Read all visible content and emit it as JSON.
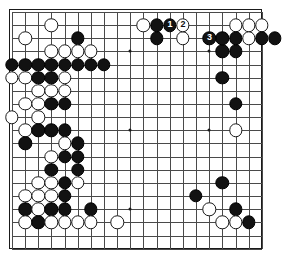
{
  "diagram": {
    "board": {
      "cols": 20,
      "rows": 19,
      "origin_x": 11,
      "origin_y": 11,
      "spacing": 13.15,
      "line_color": "#4a4a4a",
      "border_color": "#1a1a1a",
      "background_color": "#ffffff",
      "black_color": "#121212",
      "white_color": "#ffffff"
    },
    "hoshi": [
      {
        "c": 3,
        "r": 3
      },
      {
        "c": 9,
        "r": 3
      },
      {
        "c": 15,
        "r": 3
      },
      {
        "c": 3,
        "r": 9
      },
      {
        "c": 9,
        "r": 9
      },
      {
        "c": 15,
        "r": 9
      },
      {
        "c": 3,
        "r": 15
      },
      {
        "c": 9,
        "r": 15
      },
      {
        "c": 15,
        "r": 15
      }
    ],
    "stones": [
      {
        "c": 10,
        "r": 1,
        "color": "white"
      },
      {
        "c": 11,
        "r": 1,
        "color": "black"
      },
      {
        "c": 3,
        "r": 1,
        "color": "white"
      },
      {
        "c": 17,
        "r": 1,
        "color": "white"
      },
      {
        "c": 18,
        "r": 1,
        "color": "white"
      },
      {
        "c": 19,
        "r": 1,
        "color": "white"
      },
      {
        "c": 1,
        "r": 2,
        "color": "white"
      },
      {
        "c": 5,
        "r": 2,
        "color": "black"
      },
      {
        "c": 11,
        "r": 2,
        "color": "black"
      },
      {
        "c": 17,
        "r": 2,
        "color": "black"
      },
      {
        "c": 18,
        "r": 2,
        "color": "white"
      },
      {
        "c": 19,
        "r": 2,
        "color": "black"
      },
      {
        "c": 20,
        "r": 2,
        "color": "black"
      },
      {
        "c": 3,
        "r": 3,
        "color": "white"
      },
      {
        "c": 4,
        "r": 3,
        "color": "white"
      },
      {
        "c": 5,
        "r": 3,
        "color": "white"
      },
      {
        "c": 6,
        "r": 3,
        "color": "white"
      },
      {
        "c": 16,
        "r": 3,
        "color": "black"
      },
      {
        "c": 17,
        "r": 3,
        "color": "black"
      },
      {
        "c": 0,
        "r": 4,
        "color": "black"
      },
      {
        "c": 1,
        "r": 4,
        "color": "black"
      },
      {
        "c": 2,
        "r": 4,
        "color": "black"
      },
      {
        "c": 3,
        "r": 4,
        "color": "black"
      },
      {
        "c": 4,
        "r": 4,
        "color": "black"
      },
      {
        "c": 5,
        "r": 4,
        "color": "black"
      },
      {
        "c": 6,
        "r": 4,
        "color": "black"
      },
      {
        "c": 7,
        "r": 4,
        "color": "black"
      },
      {
        "c": 0,
        "r": 5,
        "color": "white"
      },
      {
        "c": 1,
        "r": 5,
        "color": "white"
      },
      {
        "c": 2,
        "r": 5,
        "color": "black"
      },
      {
        "c": 3,
        "r": 5,
        "color": "black"
      },
      {
        "c": 4,
        "r": 5,
        "color": "white"
      },
      {
        "c": 16,
        "r": 5,
        "color": "black"
      },
      {
        "c": 2,
        "r": 6,
        "color": "white"
      },
      {
        "c": 3,
        "r": 6,
        "color": "white"
      },
      {
        "c": 4,
        "r": 6,
        "color": "white"
      },
      {
        "c": 1,
        "r": 7,
        "color": "white"
      },
      {
        "c": 2,
        "r": 7,
        "color": "white"
      },
      {
        "c": 3,
        "r": 7,
        "color": "black"
      },
      {
        "c": 4,
        "r": 7,
        "color": "black"
      },
      {
        "c": 17,
        "r": 7,
        "color": "black"
      },
      {
        "c": 0,
        "r": 8,
        "color": "white"
      },
      {
        "c": 2,
        "r": 8,
        "color": "white"
      },
      {
        "c": 1,
        "r": 9,
        "color": "white"
      },
      {
        "c": 2,
        "r": 9,
        "color": "black"
      },
      {
        "c": 3,
        "r": 9,
        "color": "black"
      },
      {
        "c": 4,
        "r": 9,
        "color": "black"
      },
      {
        "c": 17,
        "r": 9,
        "color": "white"
      },
      {
        "c": 1,
        "r": 10,
        "color": "black"
      },
      {
        "c": 4,
        "r": 10,
        "color": "white"
      },
      {
        "c": 5,
        "r": 10,
        "color": "black"
      },
      {
        "c": 3,
        "r": 11,
        "color": "white"
      },
      {
        "c": 4,
        "r": 11,
        "color": "black"
      },
      {
        "c": 5,
        "r": 11,
        "color": "black"
      },
      {
        "c": 3,
        "r": 12,
        "color": "black"
      },
      {
        "c": 5,
        "r": 12,
        "color": "black"
      },
      {
        "c": 2,
        "r": 13,
        "color": "white"
      },
      {
        "c": 3,
        "r": 13,
        "color": "white"
      },
      {
        "c": 4,
        "r": 13,
        "color": "black"
      },
      {
        "c": 5,
        "r": 13,
        "color": "white"
      },
      {
        "c": 16,
        "r": 13,
        "color": "black"
      },
      {
        "c": 1,
        "r": 14,
        "color": "white"
      },
      {
        "c": 2,
        "r": 14,
        "color": "white"
      },
      {
        "c": 3,
        "r": 14,
        "color": "white"
      },
      {
        "c": 4,
        "r": 14,
        "color": "black"
      },
      {
        "c": 14,
        "r": 14,
        "color": "black"
      },
      {
        "c": 1,
        "r": 15,
        "color": "black"
      },
      {
        "c": 2,
        "r": 15,
        "color": "white"
      },
      {
        "c": 3,
        "r": 15,
        "color": "black"
      },
      {
        "c": 4,
        "r": 15,
        "color": "black"
      },
      {
        "c": 6,
        "r": 15,
        "color": "black"
      },
      {
        "c": 15,
        "r": 15,
        "color": "white"
      },
      {
        "c": 17,
        "r": 15,
        "color": "black"
      },
      {
        "c": 1,
        "r": 16,
        "color": "white"
      },
      {
        "c": 2,
        "r": 16,
        "color": "black"
      },
      {
        "c": 3,
        "r": 16,
        "color": "white"
      },
      {
        "c": 4,
        "r": 16,
        "color": "white"
      },
      {
        "c": 5,
        "r": 16,
        "color": "white"
      },
      {
        "c": 6,
        "r": 16,
        "color": "white"
      },
      {
        "c": 8,
        "r": 16,
        "color": "white"
      },
      {
        "c": 16,
        "r": 16,
        "color": "white"
      },
      {
        "c": 17,
        "r": 16,
        "color": "white"
      },
      {
        "c": 18,
        "r": 16,
        "color": "black"
      }
    ],
    "moves": [
      {
        "c": 12,
        "r": 1,
        "color": "black",
        "label": "1"
      },
      {
        "c": 13,
        "r": 1,
        "color": "white",
        "label": "2"
      },
      {
        "c": 15,
        "r": 2,
        "color": "black",
        "label": "3"
      }
    ],
    "extra_stones": [
      {
        "c": 13,
        "r": 2,
        "color": "white"
      },
      {
        "c": 16,
        "r": 2,
        "color": "black"
      }
    ]
  }
}
